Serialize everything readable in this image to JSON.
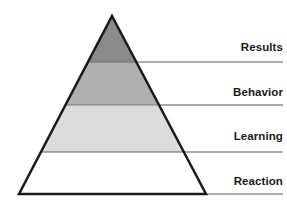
{
  "diagram": {
    "type": "four-level-pyramid",
    "title_visible": false,
    "background_color": "#ffffff",
    "outline_color": "#1a1a1a",
    "outline_width_px": 2.5,
    "leader_line_color": "#8f8f8f",
    "label_color": "#1a1a1a",
    "geometry": {
      "apex_x": 112,
      "apex_y": 16,
      "base_left_x": 19,
      "base_right_x": 206,
      "base_y": 194,
      "divider_y": [
        62,
        105,
        152
      ],
      "leader_line_end_x": 283
    },
    "levels": [
      {
        "label": "Results",
        "fill": "#8a8a8a",
        "order": 4,
        "position": "top",
        "band_top_y": 16,
        "band_bottom_y": 62
      },
      {
        "label": "Behavior",
        "fill": "#b0b0b0",
        "order": 3,
        "position": "upper-middle",
        "band_top_y": 62,
        "band_bottom_y": 105
      },
      {
        "label": "Learning",
        "fill": "#dcdcdc",
        "order": 2,
        "position": "lower-middle",
        "band_top_y": 105,
        "band_bottom_y": 152
      },
      {
        "label": "Reaction",
        "fill": "#ffffff",
        "order": 1,
        "position": "bottom",
        "band_top_y": 152,
        "band_bottom_y": 194
      }
    ]
  }
}
